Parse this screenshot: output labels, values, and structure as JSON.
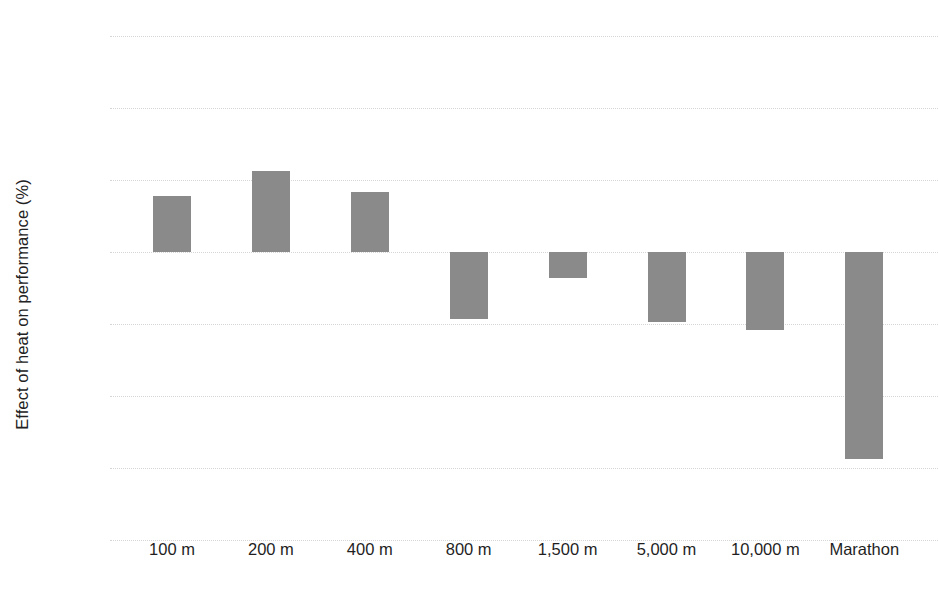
{
  "chart_data": {
    "type": "bar",
    "title": "",
    "subtitle": "",
    "xlabel": "",
    "ylabel": "Effect of heat on performance (%)",
    "categories": [
      "100 m",
      "200 m",
      "400 m",
      "800 m",
      "1,500 m",
      "5,000 m",
      "10,000 m",
      "Marathon"
    ],
    "values": [
      0.78,
      1.13,
      0.83,
      -0.93,
      -0.36,
      -0.97,
      -1.08,
      -2.87
    ],
    "series": [
      {
        "name": "Effect of heat on performance",
        "values": [
          0.78,
          1.13,
          0.83,
          -0.93,
          -0.36,
          -0.97,
          -1.08,
          -2.87
        ]
      }
    ],
    "ylim": [
      -4,
      3
    ],
    "ytick_labels": [
      "3%",
      "2%",
      "1%",
      "0%",
      "-1%",
      "-2%",
      "-3%",
      "-4%"
    ],
    "ytick_values": [
      3,
      2,
      1,
      0,
      -1,
      -2,
      -3,
      -4
    ],
    "grid": true,
    "grid_axis": "y",
    "legend": false,
    "legend_position": "none",
    "bar_color": "#8a8a8a",
    "gridline_color": "#d6d6d6",
    "background_color": "#ffffff",
    "text_color": "#1f1f1f"
  }
}
